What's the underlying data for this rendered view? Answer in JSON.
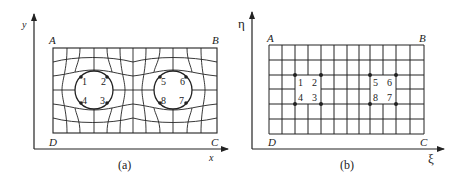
{
  "figure": {
    "panel_a": {
      "caption": "(a)",
      "axis_x_label": "x",
      "axis_y_label": "y",
      "corners": {
        "A": "A",
        "B": "B",
        "C": "C",
        "D": "D"
      },
      "description": "Physical domain with two circular holes; curvilinear grid deforming around them",
      "points": [
        "1",
        "2",
        "3",
        "4",
        "5",
        "6",
        "7",
        "8"
      ]
    },
    "panel_b": {
      "caption": "(b)",
      "axis_x_label": "ξ",
      "axis_y_label": "η",
      "corners": {
        "A": "A",
        "B": "B",
        "C": "C",
        "D": "D"
      },
      "description": "Computational domain: uniform rectangular grid with two square blocked regions",
      "points": [
        "1",
        "2",
        "3",
        "4",
        "5",
        "6",
        "7",
        "8"
      ],
      "grid": {
        "columns": 12,
        "rows": 6
      }
    },
    "colors": {
      "line": "#222222",
      "background": "#ffffff"
    }
  }
}
